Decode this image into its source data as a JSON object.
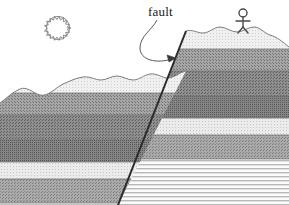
{
  "figure": {
    "background_color": "#ffffff",
    "width": 289,
    "height": 205
  },
  "annotations": {
    "fault_label": "fault",
    "fault_label_x": 148,
    "fault_label_y": 4
  },
  "icons": {
    "sun": "sun-icon",
    "person": "stick-figure-icon",
    "leader": "leader-line-arrow-icon"
  },
  "sun": {
    "center_x": 58,
    "center_y": 28,
    "radius": 13,
    "ray_count": 18,
    "ray_length": 3.5,
    "stroke": "#8a8a8a"
  },
  "person": {
    "head_center_x": 243,
    "head_center_y": 13,
    "head_radius": 4,
    "body_bottom_y": 33,
    "stroke": "#4a4a4a"
  },
  "fault": {
    "type": "normal",
    "dip_direction": "left",
    "top_x": 186,
    "top_y": 31,
    "bottom_x": 118,
    "bottom_y": 205,
    "stroke": "#2b2b2b",
    "stroke_width": 2.0,
    "offset_px": 44,
    "leader_path": "M 157 20 C 152 30, 140 36, 140 48 C 140 60, 156 64, 172 59",
    "arrow_tip_x": 176,
    "arrow_tip_y": 58
  },
  "ground_surface": {
    "left_block_label": "downthrown-block",
    "right_block_label": "upthrown-block",
    "stroke": "#7d7d7d",
    "left_path": "M 0 103 C 6 99, 12 92, 20 89 C 27 86, 33 93, 40 95 C 48 97, 55 88, 63 84 C 70 81, 76 78, 83 77 C 90 76, 95 80, 101 80 C 107 80, 111 76, 117 76 C 123 76, 127 80, 133 80 C 139 80, 144 75, 150 74 C 157 73, 162 78, 168 78 C 174 78, 180 72, 186 71",
    "right_path": "M 186 31 C 192 29, 197 33, 203 33 C 209 33, 214 27, 220 27 C 226 27, 231 32, 237 32 C 243 32, 248 27, 254 27 C 260 27, 264 33, 270 35 C 277 37, 283 42, 289 47"
  },
  "strata": {
    "note": "Layer tops measured on the right (upthrown) block; left block is dropped by the fault offset.",
    "layers": [
      {
        "name": "topsoil-layer",
        "pattern": "light-stipple",
        "color": "#ececec",
        "top_right": 31,
        "thickness": 18
      },
      {
        "name": "upper-shale-layer",
        "pattern": "medium-stipple",
        "color": "#9a9a9a",
        "top_right": 49,
        "thickness": 22
      },
      {
        "name": "mid-sandstone-layer",
        "pattern": "dark-stipple",
        "color": "#888888",
        "top_right": 71,
        "thickness": 25
      },
      {
        "name": "dark-siltstone-layer",
        "pattern": "dense-stipple",
        "color": "#7e7e7e",
        "top_right": 96,
        "thickness": 22
      },
      {
        "name": "pale-limestone-layer",
        "pattern": "fine-stipple",
        "color": "#e4e4e4",
        "top_right": 118,
        "thickness": 17
      },
      {
        "name": "lower-mudstone-layer",
        "pattern": "medium-stipple",
        "color": "#9e9e9e",
        "top_right": 135,
        "thickness": 24
      },
      {
        "name": "basement-striped-layer",
        "pattern": "horizontal-lines",
        "color": "#d8d8d8",
        "top_right": 159,
        "thickness": 46
      }
    ]
  }
}
